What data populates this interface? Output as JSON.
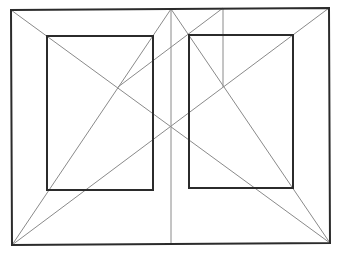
{
  "diagram": {
    "title": "",
    "colors": {
      "background": "#ffffff",
      "thick_stroke": "#2b2b2b",
      "thin_stroke": "#8a8a8a"
    },
    "outer_sheet": {
      "points": [
        [
          11,
          10
        ],
        [
          329,
          8
        ],
        [
          330,
          243
        ],
        [
          12,
          245
        ]
      ]
    },
    "left_text_block": {
      "x1": 47,
      "y1": 36,
      "x2": 153,
      "y2": 190
    },
    "right_text_block": {
      "x1": 189,
      "y1": 35,
      "x2": 293,
      "y2": 188
    },
    "spine": {
      "x1": 171,
      "y1": 9,
      "x2": 171,
      "y2": 244
    },
    "construction_lines": [
      {
        "name": "sheet-diagonal-tl-br",
        "x1": 11,
        "y1": 10,
        "x2": 330,
        "y2": 243
      },
      {
        "name": "sheet-diagonal-bl-tr",
        "x1": 12,
        "y1": 245,
        "x2": 329,
        "y2": 8
      },
      {
        "name": "left-page-diagonal",
        "x1": 171,
        "y1": 9,
        "x2": 12,
        "y2": 245
      },
      {
        "name": "right-page-diagonal",
        "x1": 171,
        "y1": 9,
        "x2": 330,
        "y2": 243
      },
      {
        "name": "vertical-construction",
        "x1": 223,
        "y1": 8,
        "x2": 223,
        "y2": 87
      },
      {
        "name": "transfer-line",
        "x1": 223,
        "y1": 8,
        "x2": 118,
        "y2": 87
      }
    ]
  }
}
